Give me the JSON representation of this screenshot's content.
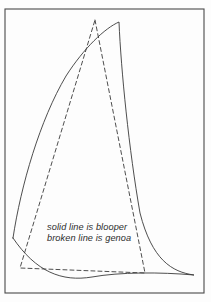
{
  "figure": {
    "background_color": "#fdfdfd",
    "border": {
      "name": "frame-border",
      "color": "#4a4a4a",
      "x": 5,
      "y": 9,
      "width": 199,
      "height": 284,
      "stroke_width": 1.1
    },
    "line_color": "#3a3a3a",
    "shapes": [
      {
        "name": "blooper-sail",
        "style": "solid",
        "label": "blooper",
        "stroke_width": 0.9,
        "path": "M 13 238 C 21 185 40 120 66 76 C 84 48 105 28 119 22 L 119 22 C 121 70 129 150 140 213 C 152 260 172 272 194 275 C 160 272 120 272 92 277 C 62 282 36 272 13 238 Z"
      },
      {
        "name": "genoa-sail",
        "style": "dashed",
        "label": "genoa",
        "stroke_width": 0.9,
        "dash_pattern": "4 3",
        "path": "M 95 20 L 145 273 L 20 268 Z"
      }
    ],
    "caption": {
      "name": "legend-caption",
      "x": 47,
      "lines": [
        {
          "text": "solid line is blooper",
          "y": 230
        },
        {
          "text": "broken line is genoa",
          "y": 241
        }
      ]
    }
  }
}
